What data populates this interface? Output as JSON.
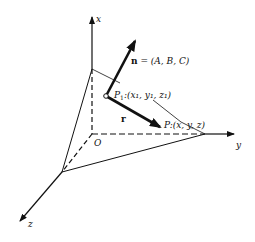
{
  "diagram": {
    "axes": {
      "x_label": "x",
      "y_label": "y",
      "z_label": "z",
      "origin_label": "O"
    },
    "normal_vector": {
      "symbol": "n",
      "equals": " = ",
      "components": "(A, B, C)"
    },
    "point_p1": {
      "label": "P",
      "subscript": "1",
      "coords": ":(x₁, y₁, z₁)"
    },
    "point_p": {
      "label": "P",
      "coords": ":(x, y, z)"
    },
    "vector_r": {
      "symbol": "r"
    },
    "colors": {
      "ink": "#111111",
      "background": "#ffffff"
    }
  }
}
